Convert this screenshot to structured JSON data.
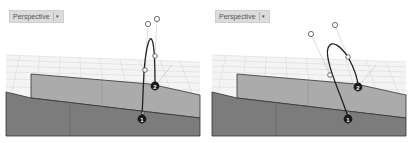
{
  "viewports": [
    {
      "label": "Perspective",
      "dropdown_icon": "chevron-down-icon",
      "markers": [
        {
          "label": "1"
        },
        {
          "label": "2"
        }
      ]
    },
    {
      "label": "Perspective",
      "dropdown_icon": "chevron-down-icon",
      "markers": [
        {
          "label": "1"
        },
        {
          "label": "2"
        }
      ]
    }
  ],
  "colors": {
    "grid": "#d0d0d0",
    "surface_top": "#a9a9a9",
    "surface_front": "#7a7a7a",
    "curve": "#222222",
    "marker": "#1a1a1a"
  }
}
